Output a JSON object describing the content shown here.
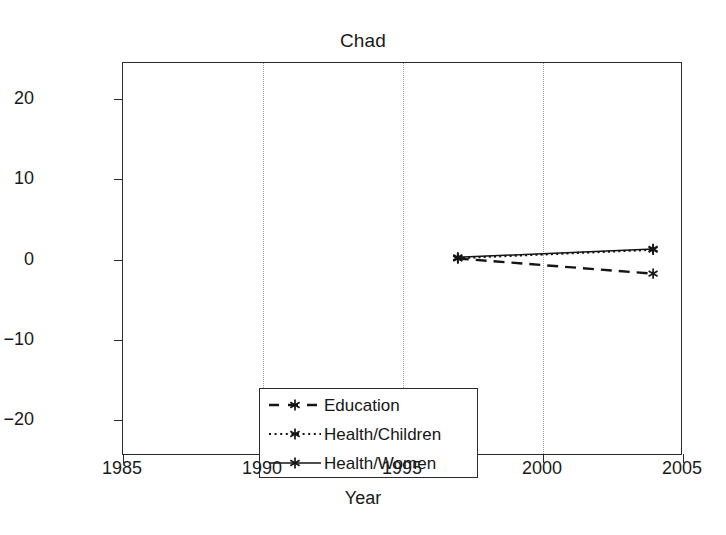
{
  "chart_data": {
    "type": "line",
    "title": "Chad",
    "xlabel": "Year",
    "ylabel": "% change in poverty headcount",
    "xlim": [
      1985,
      2005
    ],
    "ylim": [
      -24.5,
      24.5
    ],
    "xticks": [
      1985,
      1990,
      1995,
      2000,
      2005
    ],
    "xtick_labels": [
      "1985",
      "1990",
      "1995",
      "2000",
      "2005"
    ],
    "yticks": [
      20,
      10,
      0,
      -10,
      -20
    ],
    "ytick_labels": [
      "20",
      "10",
      "0",
      "−10",
      "−20"
    ],
    "grid": "vertical-dotted",
    "legend_position": "lower-left-inside",
    "series": [
      {
        "name": "Education",
        "linestyle": "dashed",
        "marker": "asterisk",
        "color": "#151515",
        "x": [
          1997,
          2004
        ],
        "values": [
          0.0,
          -1.9
        ]
      },
      {
        "name": "Health/Children",
        "linestyle": "dotted",
        "marker": "asterisk",
        "color": "#151515",
        "x": [
          1997,
          2004
        ],
        "values": [
          0.05,
          1.1
        ]
      },
      {
        "name": "Health/Women",
        "linestyle": "solid",
        "marker": "asterisk",
        "color": "#151515",
        "x": [
          1997,
          2004
        ],
        "values": [
          0.15,
          1.2
        ]
      }
    ]
  },
  "legend": {
    "items": [
      {
        "label": "Education"
      },
      {
        "label": "Health/Children"
      },
      {
        "label": "Health/Women"
      }
    ]
  }
}
